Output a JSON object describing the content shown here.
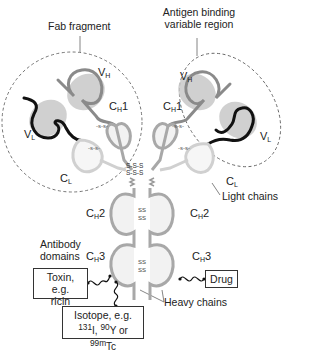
{
  "labels": {
    "fab_fragment": "Fab fragment",
    "antigen_binding": "Antigen binding variable region",
    "antigen_binding_line1": "Antigen binding",
    "antigen_binding_line2": "variable region",
    "light_chains": "Light chains",
    "heavy_chains": "Heavy chains",
    "antibody_domains_line1": "Antibody",
    "antibody_domains_line2": "domains"
  },
  "domains": {
    "vh": {
      "main": "V",
      "sub": "H"
    },
    "vl": {
      "main": "V",
      "sub": "L"
    },
    "ch1": {
      "main": "C",
      "sub": "H",
      "suffix": "1"
    },
    "cl": {
      "main": "C",
      "sub": "L"
    },
    "ch2": {
      "main": "C",
      "sub": "H",
      "suffix": "2"
    },
    "ch3": {
      "main": "C",
      "sub": "H",
      "suffix": "3"
    }
  },
  "payloads": {
    "toxin_line1": "Toxin, e.g.",
    "toxin_line2": "ricin",
    "drug": "Drug",
    "isotope_line1": "Isotope, e.g.",
    "isotope_131": "131",
    "isotope_I": "I, ",
    "isotope_90": "90",
    "isotope_Y": "Y or ",
    "isotope_99m": "99m",
    "isotope_Tc": "Tc"
  },
  "colors": {
    "heavy_chain": "#9a9a9a",
    "light_chain_variable": "#111111",
    "light_chain_constant": "#d0d0d0",
    "variable_fill": "#c8c8c8",
    "constant_fill": "#f2f2f2",
    "dashed_outline": "#555555"
  }
}
